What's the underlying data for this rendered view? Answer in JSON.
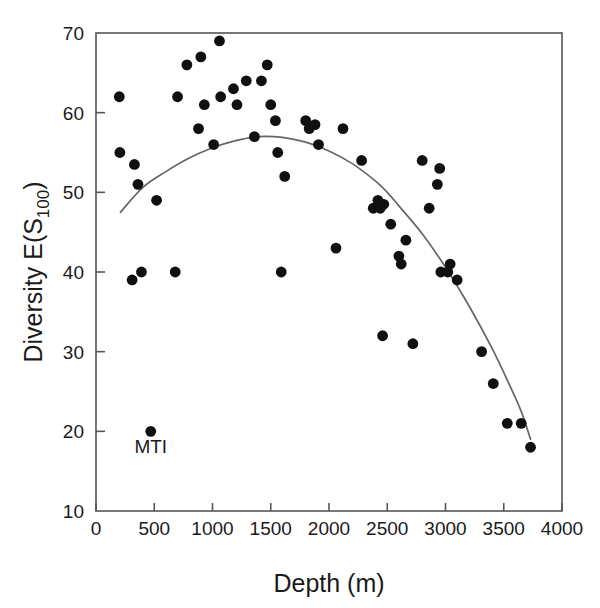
{
  "chart_data": {
    "type": "scatter",
    "title": "",
    "xlabel": "Depth (m)",
    "ylabel": "Diversity E(S",
    "ylabel_sub": "100",
    "ylabel_close": ")",
    "xlim": [
      0,
      4000
    ],
    "ylim": [
      10,
      70
    ],
    "xticks": [
      0,
      500,
      1000,
      1500,
      2000,
      2500,
      3000,
      3500,
      4000
    ],
    "xtick_labels": [
      "0",
      "500",
      "1000",
      "1500",
      "2000",
      "2500",
      "3000",
      "3500",
      "4000"
    ],
    "yticks": [
      10,
      20,
      30,
      40,
      50,
      60,
      70
    ],
    "ytick_labels": [
      "10",
      "20",
      "30",
      "40",
      "50",
      "60",
      "70"
    ],
    "grid": false,
    "legend": false,
    "marker_color": "#101010",
    "curve_color": "#666666",
    "axis_color": "#555555",
    "points": [
      {
        "x": 200,
        "y": 62
      },
      {
        "x": 205,
        "y": 55
      },
      {
        "x": 330,
        "y": 53.5
      },
      {
        "x": 360,
        "y": 51
      },
      {
        "x": 310,
        "y": 39
      },
      {
        "x": 390,
        "y": 40
      },
      {
        "x": 470,
        "y": 20
      },
      {
        "x": 520,
        "y": 49
      },
      {
        "x": 680,
        "y": 40
      },
      {
        "x": 700,
        "y": 62
      },
      {
        "x": 780,
        "y": 66
      },
      {
        "x": 880,
        "y": 58
      },
      {
        "x": 900,
        "y": 67
      },
      {
        "x": 930,
        "y": 61
      },
      {
        "x": 1010,
        "y": 56
      },
      {
        "x": 1060,
        "y": 69
      },
      {
        "x": 1070,
        "y": 62
      },
      {
        "x": 1180,
        "y": 63
      },
      {
        "x": 1210,
        "y": 61
      },
      {
        "x": 1290,
        "y": 64
      },
      {
        "x": 1360,
        "y": 57
      },
      {
        "x": 1420,
        "y": 64
      },
      {
        "x": 1470,
        "y": 66
      },
      {
        "x": 1500,
        "y": 61
      },
      {
        "x": 1540,
        "y": 59
      },
      {
        "x": 1560,
        "y": 55
      },
      {
        "x": 1590,
        "y": 40
      },
      {
        "x": 1620,
        "y": 52
      },
      {
        "x": 1800,
        "y": 59
      },
      {
        "x": 1830,
        "y": 58
      },
      {
        "x": 1880,
        "y": 58.5
      },
      {
        "x": 1910,
        "y": 56
      },
      {
        "x": 2060,
        "y": 43
      },
      {
        "x": 2120,
        "y": 58
      },
      {
        "x": 2280,
        "y": 54
      },
      {
        "x": 2380,
        "y": 48
      },
      {
        "x": 2420,
        "y": 49
      },
      {
        "x": 2440,
        "y": 48
      },
      {
        "x": 2460,
        "y": 32
      },
      {
        "x": 2470,
        "y": 48.5
      },
      {
        "x": 2530,
        "y": 46
      },
      {
        "x": 2600,
        "y": 42
      },
      {
        "x": 2620,
        "y": 41
      },
      {
        "x": 2660,
        "y": 44
      },
      {
        "x": 2720,
        "y": 31
      },
      {
        "x": 2800,
        "y": 54
      },
      {
        "x": 2860,
        "y": 48
      },
      {
        "x": 2930,
        "y": 51
      },
      {
        "x": 2950,
        "y": 53
      },
      {
        "x": 2960,
        "y": 40
      },
      {
        "x": 3020,
        "y": 40
      },
      {
        "x": 3040,
        "y": 41
      },
      {
        "x": 3100,
        "y": 39
      },
      {
        "x": 3310,
        "y": 30
      },
      {
        "x": 3410,
        "y": 26
      },
      {
        "x": 3530,
        "y": 21
      },
      {
        "x": 3650,
        "y": 21
      },
      {
        "x": 3730,
        "y": 18
      }
    ],
    "fit_curve": [
      {
        "x": 210,
        "y": 47.5
      },
      {
        "x": 400,
        "y": 50.6
      },
      {
        "x": 600,
        "y": 52.6
      },
      {
        "x": 800,
        "y": 54.3
      },
      {
        "x": 1000,
        "y": 55.6
      },
      {
        "x": 1200,
        "y": 56.5
      },
      {
        "x": 1400,
        "y": 57.0
      },
      {
        "x": 1600,
        "y": 56.9
      },
      {
        "x": 1800,
        "y": 56.3
      },
      {
        "x": 2000,
        "y": 55.2
      },
      {
        "x": 2200,
        "y": 53.6
      },
      {
        "x": 2400,
        "y": 51.4
      },
      {
        "x": 2500,
        "y": 50.0
      },
      {
        "x": 2600,
        "y": 48.3
      },
      {
        "x": 2800,
        "y": 44.8
      },
      {
        "x": 3000,
        "y": 40.6
      },
      {
        "x": 3200,
        "y": 35.8
      },
      {
        "x": 3400,
        "y": 30.4
      },
      {
        "x": 3550,
        "y": 25.8
      },
      {
        "x": 3650,
        "y": 22.5
      },
      {
        "x": 3730,
        "y": 19.0
      }
    ],
    "annotations": [
      {
        "text": "MTI",
        "x": 470,
        "y": 20,
        "dx": 0,
        "dy": -22
      }
    ]
  }
}
